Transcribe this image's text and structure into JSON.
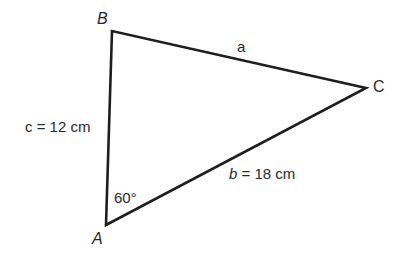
{
  "diagram": {
    "type": "triangle",
    "stroke_color": "#1e1e1e",
    "text_color": "#2a2a2a",
    "background": "#ffffff",
    "vertices": {
      "A": {
        "label": "A",
        "x": 106,
        "y": 225
      },
      "B": {
        "label": "B",
        "x": 112,
        "y": 31
      },
      "C": {
        "label": "C",
        "x": 366,
        "y": 88
      }
    },
    "sides": {
      "a": {
        "var": "a",
        "label": "a",
        "between": [
          "B",
          "C"
        ]
      },
      "b": {
        "var": "b",
        "equals": " = 18 cm",
        "label": "b = 18 cm",
        "between": [
          "A",
          "C"
        ]
      },
      "c": {
        "var": "c",
        "equals": " = 12 cm",
        "label": "c = 12 cm",
        "between": [
          "A",
          "B"
        ]
      }
    },
    "angle_A": {
      "label": "60°",
      "value_degrees": 60
    }
  }
}
